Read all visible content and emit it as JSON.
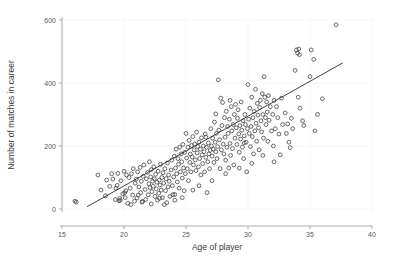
{
  "chart_data": {
    "type": "scatter",
    "title": "",
    "xlabel": "Age of player",
    "ylabel": "Number of matches in career",
    "xlim": [
      15,
      40
    ],
    "ylim": [
      0,
      620
    ],
    "xticks": [
      15,
      20,
      25,
      30,
      35,
      40
    ],
    "yticks": [
      0,
      200,
      400,
      600
    ],
    "xtick_labels": [
      "15",
      "20",
      "25",
      "30",
      "35",
      "40"
    ],
    "ytick_labels": [
      "0",
      "200",
      "400",
      "600"
    ],
    "grid": "faint",
    "legend": "none",
    "marker": "open-circle",
    "marker_color": "#3a3a3a",
    "marker_radius": 1.9,
    "trendline": {
      "type": "linear",
      "x_start": 17.05,
      "y_start": 8,
      "x_end": 37.6,
      "y_end": 463,
      "color": "#2b2b2b"
    },
    "points": [
      [
        16.05,
        25
      ],
      [
        16.15,
        22
      ],
      [
        17.9,
        108
      ],
      [
        18.15,
        60
      ],
      [
        18.5,
        42
      ],
      [
        18.85,
        72
      ],
      [
        19.0,
        112
      ],
      [
        19.1,
        95
      ],
      [
        19.3,
        30
      ],
      [
        19.45,
        75
      ],
      [
        19.5,
        113
      ],
      [
        19.6,
        26
      ],
      [
        19.65,
        34
      ],
      [
        19.7,
        28
      ],
      [
        19.75,
        90
      ],
      [
        19.9,
        48
      ],
      [
        20.0,
        120
      ],
      [
        20.1,
        36
      ],
      [
        20.15,
        58
      ],
      [
        20.2,
        108
      ],
      [
        20.3,
        18
      ],
      [
        20.4,
        100
      ],
      [
        20.5,
        66
      ],
      [
        20.6,
        112
      ],
      [
        20.7,
        44
      ],
      [
        20.75,
        128
      ],
      [
        20.85,
        25
      ],
      [
        20.9,
        82
      ],
      [
        21.0,
        95
      ],
      [
        21.05,
        35
      ],
      [
        21.1,
        118
      ],
      [
        21.2,
        70
      ],
      [
        21.3,
        132
      ],
      [
        21.35,
        52
      ],
      [
        21.4,
        88
      ],
      [
        21.5,
        24
      ],
      [
        21.55,
        104
      ],
      [
        21.6,
        140
      ],
      [
        21.7,
        62
      ],
      [
        21.75,
        30
      ],
      [
        21.8,
        96
      ],
      [
        21.9,
        116
      ],
      [
        21.95,
        45
      ],
      [
        22.0,
        80
      ],
      [
        22.05,
        150
      ],
      [
        22.1,
        68
      ],
      [
        22.15,
        102
      ],
      [
        22.2,
        125
      ],
      [
        22.25,
        55
      ],
      [
        22.3,
        88
      ],
      [
        22.35,
        72
      ],
      [
        22.4,
        134
      ],
      [
        22.45,
        96
      ],
      [
        22.5,
        40
      ],
      [
        22.55,
        110
      ],
      [
        22.6,
        64
      ],
      [
        22.65,
        85
      ],
      [
        22.7,
        28
      ],
      [
        22.75,
        120
      ],
      [
        22.8,
        50
      ],
      [
        22.85,
        92
      ],
      [
        22.9,
        76
      ],
      [
        22.95,
        142
      ],
      [
        23.0,
        60
      ],
      [
        23.05,
        100
      ],
      [
        23.1,
        36
      ],
      [
        23.15,
        115
      ],
      [
        23.2,
        82
      ],
      [
        23.3,
        128
      ],
      [
        23.35,
        58
      ],
      [
        23.4,
        96
      ],
      [
        23.45,
        20
      ],
      [
        23.5,
        146
      ],
      [
        23.55,
        70
      ],
      [
        23.6,
        108
      ],
      [
        23.65,
        88
      ],
      [
        23.7,
        40
      ],
      [
        23.8,
        124
      ],
      [
        23.85,
        155
      ],
      [
        23.9,
        74
      ],
      [
        24.0,
        102
      ],
      [
        24.05,
        168
      ],
      [
        24.1,
        46
      ],
      [
        24.15,
        130
      ],
      [
        24.2,
        190
      ],
      [
        24.25,
        112
      ],
      [
        24.3,
        86
      ],
      [
        24.35,
        160
      ],
      [
        24.4,
        142
      ],
      [
        24.45,
        66
      ],
      [
        24.5,
        196
      ],
      [
        24.55,
        118
      ],
      [
        24.6,
        175
      ],
      [
        24.65,
        150
      ],
      [
        24.7,
        98
      ],
      [
        24.75,
        205
      ],
      [
        24.8,
        130
      ],
      [
        24.85,
        58
      ],
      [
        24.9,
        180
      ],
      [
        24.95,
        112
      ],
      [
        25.0,
        240
      ],
      [
        25.05,
        162
      ],
      [
        25.1,
        128
      ],
      [
        25.15,
        196
      ],
      [
        25.2,
        90
      ],
      [
        25.25,
        218
      ],
      [
        25.3,
        148
      ],
      [
        25.35,
        174
      ],
      [
        25.4,
        118
      ],
      [
        25.45,
        202
      ],
      [
        25.5,
        165
      ],
      [
        25.55,
        230
      ],
      [
        25.6,
        140
      ],
      [
        25.65,
        188
      ],
      [
        25.7,
        206
      ],
      [
        25.75,
        156
      ],
      [
        25.8,
        122
      ],
      [
        25.85,
        244
      ],
      [
        25.9,
        178
      ],
      [
        25.95,
        198
      ],
      [
        26.0,
        134
      ],
      [
        26.05,
        212
      ],
      [
        26.1,
        160
      ],
      [
        26.15,
        190
      ],
      [
        26.2,
        108
      ],
      [
        26.25,
        226
      ],
      [
        26.3,
        172
      ],
      [
        26.35,
        144
      ],
      [
        26.4,
        200
      ],
      [
        26.45,
        182
      ],
      [
        26.5,
        118
      ],
      [
        26.55,
        238
      ],
      [
        26.6,
        164
      ],
      [
        26.65,
        196
      ],
      [
        26.7,
        52
      ],
      [
        26.75,
        150
      ],
      [
        26.8,
        210
      ],
      [
        26.85,
        175
      ],
      [
        26.9,
        128
      ],
      [
        26.95,
        186
      ],
      [
        27.0,
        255
      ],
      [
        27.05,
        200
      ],
      [
        27.1,
        168
      ],
      [
        27.15,
        225
      ],
      [
        27.2,
        190
      ],
      [
        27.25,
        148
      ],
      [
        27.3,
        276
      ],
      [
        27.35,
        212
      ],
      [
        27.4,
        182
      ],
      [
        27.45,
        240
      ],
      [
        27.5,
        160
      ],
      [
        27.55,
        198
      ],
      [
        27.6,
        410
      ],
      [
        27.65,
        250
      ],
      [
        27.7,
        220
      ],
      [
        27.75,
        128
      ],
      [
        27.8,
        352
      ],
      [
        27.85,
        188
      ],
      [
        27.9,
        265
      ],
      [
        27.95,
        338
      ],
      [
        28.0,
        206
      ],
      [
        28.05,
        175
      ],
      [
        28.1,
        290
      ],
      [
        28.15,
        228
      ],
      [
        28.2,
        155
      ],
      [
        28.25,
        310
      ],
      [
        28.3,
        196
      ],
      [
        28.35,
        262
      ],
      [
        28.4,
        240
      ],
      [
        28.45,
        130
      ],
      [
        28.5,
        285
      ],
      [
        28.55,
        208
      ],
      [
        28.6,
        170
      ],
      [
        28.65,
        325
      ],
      [
        28.7,
        248
      ],
      [
        28.75,
        192
      ],
      [
        28.8,
        268
      ],
      [
        28.85,
        140
      ],
      [
        28.9,
        300
      ],
      [
        28.95,
        225
      ],
      [
        29.0,
        332
      ],
      [
        29.05,
        258
      ],
      [
        29.1,
        205
      ],
      [
        29.15,
        288
      ],
      [
        29.2,
        315
      ],
      [
        29.25,
        238
      ],
      [
        29.3,
        180
      ],
      [
        29.35,
        265
      ],
      [
        29.4,
        222
      ],
      [
        29.45,
        340
      ],
      [
        29.5,
        250
      ],
      [
        29.55,
        196
      ],
      [
        29.6,
        280
      ],
      [
        29.65,
        160
      ],
      [
        29.7,
        232
      ],
      [
        29.75,
        300
      ],
      [
        29.8,
        268
      ],
      [
        29.85,
        212
      ],
      [
        29.9,
        118
      ],
      [
        29.95,
        255
      ],
      [
        30.0,
        395
      ],
      [
        30.05,
        285
      ],
      [
        30.1,
        240
      ],
      [
        30.15,
        320
      ],
      [
        30.2,
        198
      ],
      [
        30.25,
        262
      ],
      [
        30.3,
        355
      ],
      [
        30.35,
        230
      ],
      [
        30.4,
        290
      ],
      [
        30.45,
        175
      ],
      [
        30.5,
        310
      ],
      [
        30.55,
        248
      ],
      [
        30.6,
        380
      ],
      [
        30.65,
        272
      ],
      [
        30.7,
        215
      ],
      [
        30.75,
        335
      ],
      [
        30.8,
        298
      ],
      [
        30.85,
        258
      ],
      [
        30.9,
        188
      ],
      [
        30.95,
        322
      ],
      [
        31.0,
        345
      ],
      [
        31.05,
        280
      ],
      [
        31.1,
        245
      ],
      [
        31.15,
        366
      ],
      [
        31.2,
        300
      ],
      [
        31.25,
        225
      ],
      [
        31.3,
        420
      ],
      [
        31.35,
        355
      ],
      [
        31.4,
        290
      ],
      [
        31.45,
        268
      ],
      [
        31.5,
        340
      ],
      [
        31.55,
        308
      ],
      [
        31.6,
        215
      ],
      [
        31.65,
        360
      ],
      [
        31.7,
        282
      ],
      [
        31.8,
        325
      ],
      [
        31.9,
        248
      ],
      [
        32.0,
        300
      ],
      [
        32.05,
        200
      ],
      [
        32.1,
        345
      ],
      [
        32.2,
        255
      ],
      [
        32.3,
        325
      ],
      [
        32.4,
        290
      ],
      [
        32.5,
        238
      ],
      [
        32.6,
        172
      ],
      [
        32.7,
        352
      ],
      [
        32.8,
        268
      ],
      [
        33.0,
        305
      ],
      [
        33.1,
        240
      ],
      [
        33.2,
        270
      ],
      [
        33.3,
        212
      ],
      [
        33.5,
        288
      ],
      [
        33.6,
        255
      ],
      [
        33.8,
        440
      ],
      [
        33.9,
        505
      ],
      [
        34.0,
        495
      ],
      [
        34.05,
        355
      ],
      [
        34.1,
        508
      ],
      [
        34.15,
        490
      ],
      [
        34.2,
        320
      ],
      [
        34.4,
        280
      ],
      [
        34.5,
        265
      ],
      [
        35.0,
        420
      ],
      [
        35.1,
        505
      ],
      [
        35.3,
        475
      ],
      [
        35.4,
        248
      ],
      [
        35.6,
        300
      ],
      [
        36.0,
        350
      ],
      [
        37.1,
        585
      ],
      [
        23.25,
        14
      ],
      [
        22.2,
        16
      ],
      [
        21.45,
        22
      ],
      [
        20.55,
        14
      ],
      [
        24.1,
        28
      ],
      [
        25.55,
        60
      ],
      [
        26.05,
        74
      ],
      [
        27.1,
        90
      ],
      [
        28.2,
        112
      ],
      [
        29.3,
        130
      ],
      [
        23.95,
        46
      ],
      [
        24.7,
        36
      ],
      [
        22.85,
        34
      ],
      [
        21.15,
        44
      ],
      [
        20.05,
        52
      ],
      [
        26.6,
        228
      ],
      [
        27.4,
        302
      ],
      [
        28.55,
        345
      ],
      [
        29.7,
        210
      ],
      [
        30.3,
        145
      ],
      [
        31.2,
        170
      ],
      [
        32.1,
        150
      ],
      [
        33.4,
        195
      ],
      [
        18.6,
        92
      ],
      [
        19.35,
        66
      ]
    ]
  },
  "figure": {
    "background": "#ffffff",
    "axis_color": "#9a9a9a",
    "text_color": "#4d4d4d"
  }
}
